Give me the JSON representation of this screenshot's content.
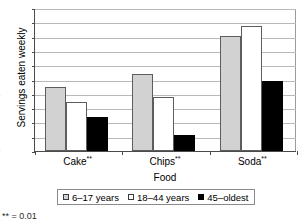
{
  "chart_data": {
    "type": "bar",
    "title": "",
    "xlabel": "Food",
    "ylabel": "Servings eaten weekly",
    "categories": [
      "Cake",
      "Chips",
      "Soda"
    ],
    "category_labels": [
      "Cake**",
      "Chips**",
      "Soda**"
    ],
    "category_significance": [
      "**",
      "**",
      "**"
    ],
    "series": [
      {
        "name": "6–17 years",
        "values": [
          4.5,
          5.4,
          8.05
        ],
        "color": "#d2d2d2"
      },
      {
        "name": "18–44 years",
        "values": [
          3.4,
          3.75,
          8.75
        ],
        "color": "#ffffff"
      },
      {
        "name": "45–oldest",
        "values": [
          2.4,
          1.1,
          4.9
        ],
        "color": "#000000"
      }
    ],
    "ylim": [
      0,
      10
    ],
    "ytick_labels": [
      "0",
      "1",
      "2",
      "3",
      "4",
      "5",
      "6",
      "7",
      "8",
      "9",
      "10"
    ],
    "ytick_values": [
      0,
      1,
      2,
      3,
      4,
      5,
      6,
      7,
      8,
      9,
      10
    ],
    "grid": true,
    "grid_axis": "y",
    "legend_position": "bottom"
  },
  "legend": {
    "entries": [
      {
        "label": "6–17 years"
      },
      {
        "label": "18–44 years"
      },
      {
        "label": "45–oldest"
      }
    ]
  },
  "footnote": {
    "text": "** = 0.01"
  }
}
